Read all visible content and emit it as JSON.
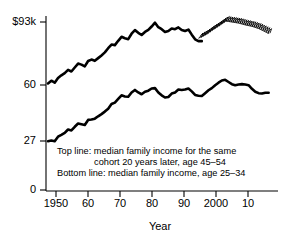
{
  "chart_data": {
    "type": "line",
    "title": "",
    "xlabel": "Year",
    "ylabel": "",
    "xlim": [
      1947,
      2014
    ],
    "ylim": [
      0,
      100
    ],
    "grid": false,
    "legend_position": "inside-annotation",
    "x_ticks": [
      {
        "value": 1950,
        "label": "1950"
      },
      {
        "value": 1960,
        "label": "60"
      },
      {
        "value": 1970,
        "label": "70"
      },
      {
        "value": 1980,
        "label": "80"
      },
      {
        "value": 1990,
        "label": "90"
      },
      {
        "value": 2000,
        "label": "2000"
      },
      {
        "value": 2010,
        "label": "10"
      }
    ],
    "y_ticks": [
      {
        "value": 0,
        "label": "0"
      },
      {
        "value": 27,
        "label": "27"
      },
      {
        "value": 60,
        "label": "60"
      },
      {
        "value": 93,
        "label": "$93k"
      }
    ],
    "annotations": [
      "Top line: median family income for the same",
      "cohort 20 years later, age 45–54",
      "Bottom line: median family income, age 25–34"
    ],
    "series": [
      {
        "name": "median family income for the same cohort 20 years later, age 45-54",
        "style": "solid-thick",
        "x": [
          1947,
          1948,
          1949,
          1950,
          1951,
          1952,
          1953,
          1954,
          1955,
          1956,
          1957,
          1958,
          1959,
          1960,
          1961,
          1962,
          1963,
          1964,
          1965,
          1966,
          1967,
          1968,
          1969,
          1970,
          1971,
          1972,
          1973,
          1974,
          1975,
          1976,
          1977,
          1978,
          1979,
          1980,
          1981,
          1982,
          1983,
          1984,
          1985,
          1986,
          1987,
          1988,
          1989,
          1990,
          1991,
          1992,
          1993
        ],
        "values": [
          59.0,
          60.5,
          59.4,
          62.0,
          63.5,
          64.7,
          66.5,
          65.6,
          67.8,
          70.0,
          69.4,
          68.4,
          71.4,
          72.2,
          71.5,
          73.0,
          74.5,
          76.2,
          78.5,
          80.5,
          80.2,
          82.6,
          84.8,
          84.0,
          83.5,
          86.5,
          88.5,
          87.0,
          85.8,
          87.5,
          88.6,
          90.5,
          92.6,
          90.1,
          89.0,
          87.5,
          88.0,
          89.4,
          89.0,
          90.0,
          88.6,
          88.0,
          88.8,
          86.0,
          83.4,
          82.4,
          82.4
        ]
      },
      {
        "name": "median family income, age 25-34",
        "style": "solid-thick",
        "x": [
          1947,
          1948,
          1949,
          1950,
          1951,
          1952,
          1953,
          1954,
          1955,
          1956,
          1957,
          1958,
          1959,
          1960,
          1961,
          1962,
          1963,
          1964,
          1965,
          1966,
          1967,
          1968,
          1969,
          1970,
          1971,
          1972,
          1973,
          1974,
          1975,
          1976,
          1977,
          1978,
          1979,
          1980,
          1981,
          1982,
          1983,
          1984,
          1985,
          1986,
          1987,
          1988,
          1989,
          1990,
          1991,
          1992,
          1993,
          1994,
          1995,
          1996,
          1997,
          1998,
          1999,
          2000,
          2001,
          2002,
          2003,
          2004,
          2005,
          2006,
          2007,
          2008,
          2009,
          2010,
          2011,
          2012,
          2013
        ],
        "values": [
          27.0,
          27.4,
          27.0,
          29.5,
          30.5,
          31.6,
          33.5,
          33.0,
          35.0,
          36.8,
          36.4,
          36.0,
          38.8,
          39.0,
          39.5,
          40.8,
          42.0,
          43.4,
          45.0,
          47.6,
          48.4,
          50.4,
          52.4,
          51.8,
          51.6,
          54.0,
          55.4,
          54.0,
          53.0,
          54.4,
          55.0,
          56.2,
          56.4,
          54.0,
          52.4,
          51.2,
          51.5,
          53.4,
          54.0,
          55.6,
          55.4,
          55.6,
          56.2,
          54.6,
          52.6,
          52.2,
          52.0,
          53.6,
          55.2,
          56.4,
          58.0,
          59.4,
          60.6,
          61.0,
          59.8,
          58.6,
          58.0,
          58.4,
          58.6,
          58.4,
          58.0,
          56.0,
          54.4,
          53.6,
          53.4,
          53.8,
          53.8
        ]
      },
      {
        "name": "cohort projection (hatched)",
        "style": "hatched",
        "x": [
          1992,
          1994,
          1996,
          1998,
          2000,
          2002,
          2004,
          2006,
          2008,
          2010,
          2012,
          2013
        ],
        "values": [
          84.0,
          86.0,
          88.6,
          91.0,
          93.6,
          93.0,
          92.4,
          91.4,
          90.6,
          89.4,
          87.6,
          86.6
        ]
      }
    ]
  }
}
